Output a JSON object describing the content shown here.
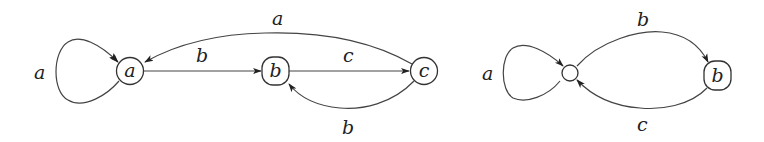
{
  "diagrams": [
    {
      "id": "left-automaton",
      "nodes": [
        {
          "id": "a",
          "label": "a",
          "shape": "circle"
        },
        {
          "id": "b",
          "label": "b",
          "shape": "rounded-rect"
        },
        {
          "id": "c",
          "label": "c",
          "shape": "circle"
        }
      ],
      "edges": [
        {
          "from": "a",
          "to": "a",
          "label": "a",
          "kind": "self-loop"
        },
        {
          "from": "a",
          "to": "b",
          "label": "b"
        },
        {
          "from": "b",
          "to": "c",
          "label": "c"
        },
        {
          "from": "c",
          "to": "a",
          "label": "a"
        },
        {
          "from": "c",
          "to": "b",
          "label": "b"
        }
      ]
    },
    {
      "id": "right-automaton",
      "nodes": [
        {
          "id": "s",
          "label": "",
          "shape": "small-circle"
        },
        {
          "id": "b",
          "label": "b",
          "shape": "rounded-rect"
        }
      ],
      "edges": [
        {
          "from": "s",
          "to": "s",
          "label": "a",
          "kind": "self-loop"
        },
        {
          "from": "s",
          "to": "b",
          "label": "b"
        },
        {
          "from": "b",
          "to": "s",
          "label": "c"
        }
      ]
    }
  ],
  "colors": {
    "stroke": "#444444",
    "text": "#222222",
    "background": "#ffffff"
  }
}
